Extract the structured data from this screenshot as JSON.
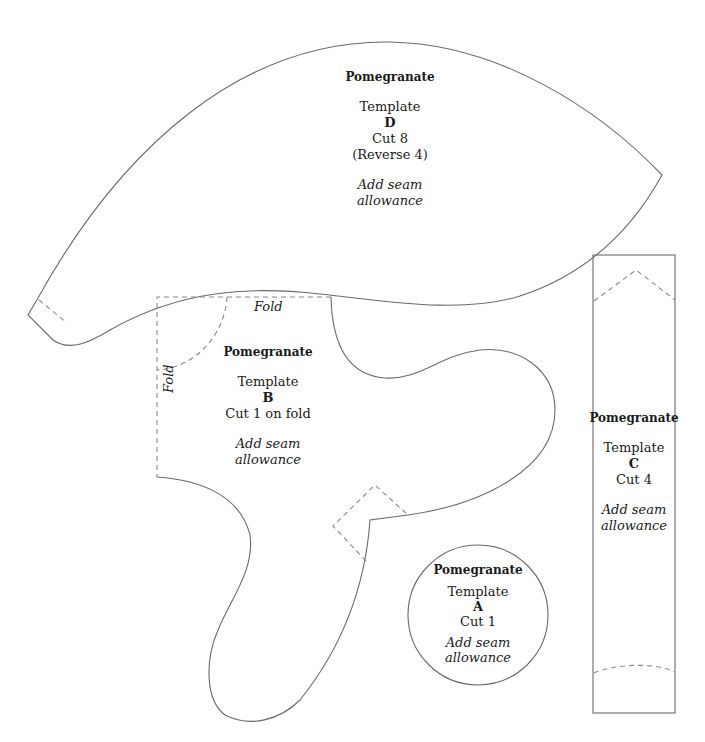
{
  "page": {
    "background": "#ffffff",
    "stroke_color": "#6a6a6a",
    "dash_color": "#8a8a8a"
  },
  "templates": {
    "D": {
      "title": "Pomegranate",
      "template_label": "Template",
      "letter": "D",
      "cut": "Cut 8",
      "note": "(Reverse 4)",
      "seam_line1": "Add seam",
      "seam_line2": "allowance"
    },
    "B": {
      "title": "Pomegranate",
      "template_label": "Template",
      "letter": "B",
      "cut": "Cut 1 on fold",
      "seam_line1": "Add seam",
      "seam_line2": "allowance",
      "fold_top": "Fold",
      "fold_left": "Fold"
    },
    "C": {
      "title": "Pomegranate",
      "template_label": "Template",
      "letter": "C",
      "cut": "Cut 4",
      "seam_line1": "Add seam",
      "seam_line2": "allowance"
    },
    "A": {
      "title": "Pomegranate",
      "template_label": "Template",
      "letter": "A",
      "cut": "Cut 1",
      "seam_line1": "Add seam",
      "seam_line2": "allowance"
    }
  }
}
